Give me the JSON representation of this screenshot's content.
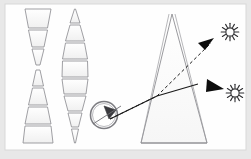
{
  "page": {
    "background_color": "#e8e8e8",
    "card_color": "#fefefe",
    "card_border_color": "#d8d8d8",
    "stroke_color": "#8f8f93",
    "ray_color": "#1a1a1a",
    "shape_fill": "#fbfbfb",
    "shape_fill_alt": "#f4f4f4"
  },
  "card": {
    "x": 5,
    "y": 4,
    "width": 241,
    "height": 146
  },
  "columns": [
    {
      "name": "left-stack",
      "label": "hourglass-stack",
      "center_x": 38,
      "shapes": [
        {
          "kind": "trapezoid",
          "top_half_width": 13,
          "bottom_half_width": 9.5,
          "y": 9,
          "height": 19
        },
        {
          "kind": "trapezoid",
          "top_half_width": 9.5,
          "bottom_half_width": 6,
          "y": 30,
          "height": 17
        },
        {
          "kind": "trapezoid",
          "top_half_width": 6,
          "bottom_half_width": 2,
          "y": 49,
          "height": 16
        },
        {
          "kind": "trapezoid",
          "top_half_width": 2,
          "bottom_half_width": 5.5,
          "y": 70,
          "height": 16
        },
        {
          "kind": "trapezoid",
          "top_half_width": 5.5,
          "bottom_half_width": 9.5,
          "y": 88,
          "height": 17
        },
        {
          "kind": "trapezoid",
          "top_half_width": 9.5,
          "bottom_half_width": 13,
          "y": 107,
          "height": 17
        },
        {
          "kind": "trapezoid",
          "top_half_width": 13,
          "bottom_half_width": 15,
          "y": 126,
          "height": 17
        }
      ]
    },
    {
      "name": "right-stack",
      "label": "lens-stack",
      "center_x": 75,
      "shapes": [
        {
          "kind": "trapezoid",
          "top_half_width": 0.5,
          "bottom_half_width": 5,
          "y": 9,
          "height": 14
        },
        {
          "kind": "trapezoid",
          "top_half_width": 5,
          "bottom_half_width": 9.5,
          "y": 25,
          "height": 16
        },
        {
          "kind": "trapezoid",
          "top_half_width": 9.5,
          "bottom_half_width": 12.5,
          "y": 43,
          "height": 16
        },
        {
          "kind": "trapezoid",
          "top_half_width": 12.5,
          "bottom_half_width": 13,
          "y": 61,
          "height": 16
        },
        {
          "kind": "trapezoid",
          "top_half_width": 13,
          "bottom_half_width": 11,
          "y": 79,
          "height": 15
        },
        {
          "kind": "trapezoid",
          "top_half_width": 11,
          "bottom_half_width": 7,
          "y": 96,
          "height": 15
        },
        {
          "kind": "trapezoid",
          "top_half_width": 7,
          "bottom_half_width": 3.5,
          "y": 113,
          "height": 14
        },
        {
          "kind": "trapezoid",
          "top_half_width": 3.5,
          "bottom_half_width": 0.5,
          "y": 129,
          "height": 14
        }
      ]
    }
  ],
  "eye": {
    "name": "eye-lens-symbol",
    "cx": 104,
    "cy": 115,
    "r": 13.5,
    "inner_r": 11.5
  },
  "cone": {
    "name": "prism-cone",
    "apex_x": 172,
    "apex_y": 14,
    "base_left_x": 141,
    "base_left_y": 143,
    "base_right_x": 207,
    "base_right_y": 143,
    "left_edge_x_mid": 156,
    "right_edge_x_mid": 196
  },
  "rays": [
    {
      "name": "incident-ray-solid",
      "style": "solid",
      "points": "110,119 157,96 196,85",
      "arrow_at": "end"
    },
    {
      "name": "refracted-ray-dashed",
      "style": "dashed",
      "points": "110,119 157,96 212,42",
      "arrow_at": "end"
    }
  ],
  "arrowheads": [
    {
      "name": "arrowhead-upper",
      "x": 209,
      "y": 44,
      "angle": -42
    },
    {
      "name": "arrowhead-lower",
      "x": 218,
      "y": 89,
      "angle": 14
    }
  ],
  "suns": [
    {
      "name": "sun-icon-upper",
      "cx": 230,
      "cy": 32,
      "r": 4.2,
      "rays": 12,
      "ray_len": 3.6
    },
    {
      "name": "sun-icon-lower",
      "cx": 235,
      "cy": 93,
      "r": 4.2,
      "rays": 12,
      "ray_len": 3.6
    }
  ]
}
